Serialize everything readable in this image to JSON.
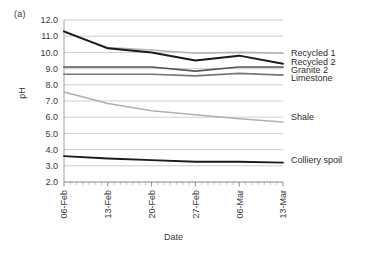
{
  "figure": {
    "panel_label": "(a)"
  },
  "chart_data": {
    "type": "line",
    "title": "",
    "panel_label": "(a)",
    "xlabel": "Date",
    "ylabel": "pH",
    "categories": [
      "06-Feb",
      "13-Feb",
      "20-Feb",
      "27-Feb",
      "06-Mar",
      "13-Mar"
    ],
    "x_tick_labels": [
      "06-Feb",
      "13-Feb",
      "20-Feb",
      "27-Feb",
      "06-Mar",
      "13-Mar"
    ],
    "y_tick_labels": [
      "12.0",
      "11.0",
      "10.0",
      "9.0",
      "8.0",
      "7.0",
      "6.0",
      "5.0",
      "4.0",
      "3.0",
      "2.0"
    ],
    "y_ticks": [
      12.0,
      11.0,
      10.0,
      9.0,
      8.0,
      7.0,
      6.0,
      5.0,
      4.0,
      3.0,
      2.0
    ],
    "ylim": [
      2.0,
      12.0
    ],
    "grid": "horizontal",
    "legend_position": "right-inline",
    "minor_x_ticks": true,
    "series": [
      {
        "name": "Recycled 1",
        "color": "#b4b4b4",
        "width": 1.6,
        "label_y": 10.0,
        "values": [
          11.25,
          10.3,
          10.15,
          9.95,
          10.0,
          9.95
        ]
      },
      {
        "name": "Recycled 2",
        "color": "#1a1a1a",
        "width": 2.0,
        "label_y": 9.45,
        "values": [
          11.3,
          10.25,
          10.0,
          9.5,
          9.8,
          9.3
        ]
      },
      {
        "name": "Granite 2",
        "color": "#555555",
        "width": 1.7,
        "label_y": 8.95,
        "values": [
          9.1,
          9.1,
          9.1,
          8.85,
          9.1,
          9.1
        ]
      },
      {
        "name": "Limestone",
        "color": "#767676",
        "width": 1.7,
        "label_y": 8.45,
        "values": [
          8.65,
          8.65,
          8.65,
          8.55,
          8.7,
          8.6
        ]
      },
      {
        "name": "Shale",
        "color": "#b0b0b0",
        "width": 1.6,
        "label_y": 6.0,
        "values": [
          7.55,
          6.85,
          6.4,
          6.15,
          5.9,
          5.7
        ]
      },
      {
        "name": "Colliery spoil",
        "color": "#1a1a1a",
        "width": 1.8,
        "label_y": 3.35,
        "values": [
          3.6,
          3.45,
          3.35,
          3.25,
          3.25,
          3.2
        ]
      }
    ]
  }
}
